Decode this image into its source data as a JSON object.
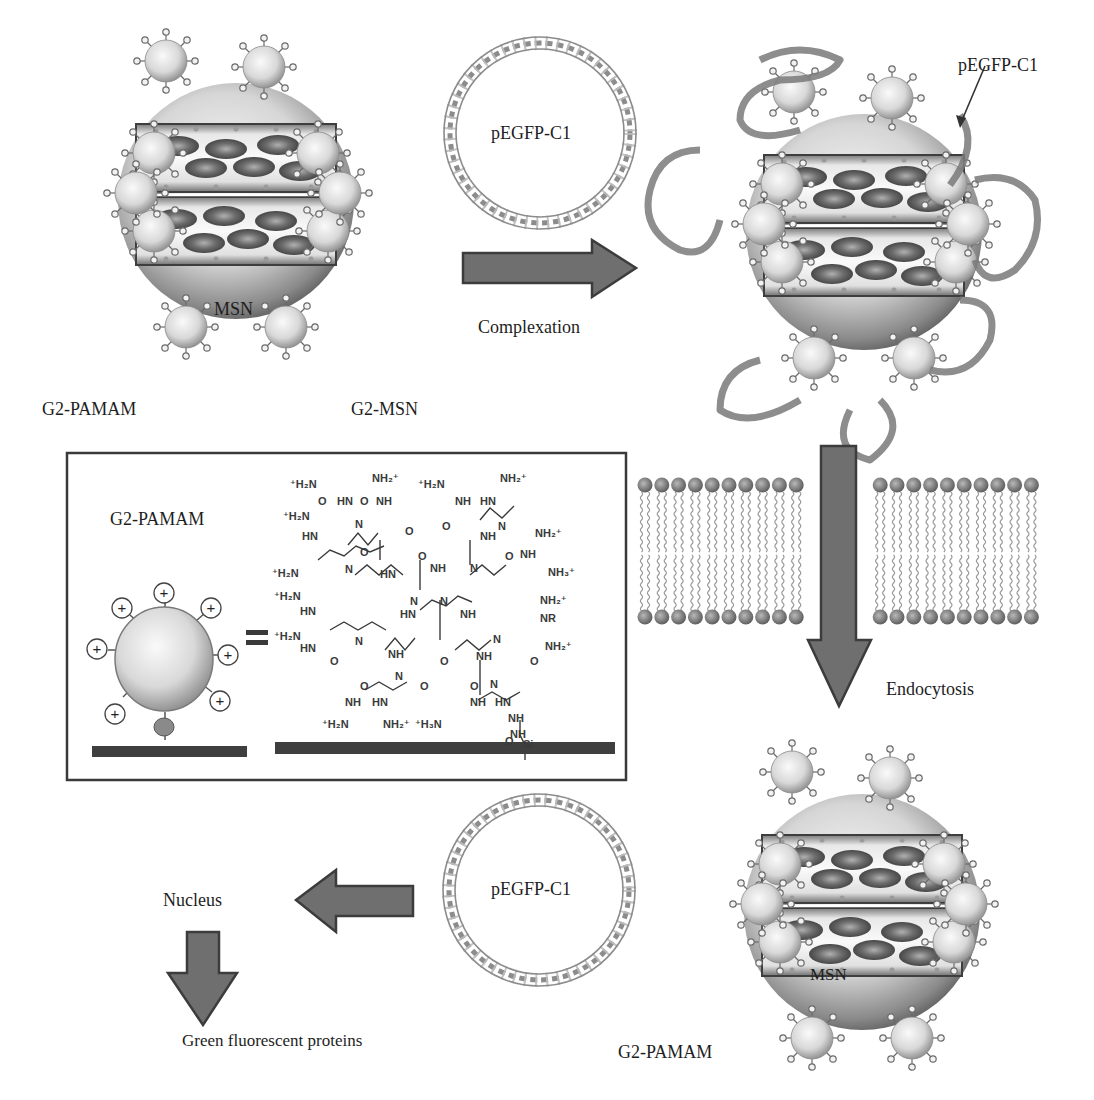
{
  "figure": {
    "colors": {
      "background": "#ffffff",
      "arrow_fill": "#6f6f6f",
      "arrow_stroke": "#3c3c3c",
      "sphere_light": "#f4f4f4",
      "sphere_dark": "#6a6a6a",
      "cargo_ellipse": "#5e5e5e",
      "plasmid_strand": "#8a8a8a",
      "membrane_head": "#808080",
      "membrane_tail": "#9a9a9a",
      "text": "#1e1e1e"
    }
  },
  "panel_top_left": {
    "core_label": "MSN",
    "dendrimer_label": "G2-PAMAM",
    "particle_label": "G2-MSN",
    "cargo_marker": "TH"
  },
  "panel_top_middle": {
    "plasmid_label": "pEGFP-C1",
    "arrow_label": "Complexation",
    "arrow_direction": "right"
  },
  "panel_top_right": {
    "plasmid_callout": "pEGFP-C1"
  },
  "inset_box": {
    "title": "G2-PAMAM",
    "equals_sign": "=",
    "charge_symbol": "+",
    "chemical_groups": [
      "+H2N",
      "NH2+",
      "HN",
      "NH",
      "O",
      "N",
      "H",
      "+H3N",
      "NH3+",
      "NHHN",
      "Si"
    ]
  },
  "membrane": {
    "arrow_label": "Endocytosis",
    "arrow_direction": "down"
  },
  "panel_bottom_right": {
    "core_label": "MSN",
    "dendrimer_label": "G2-PAMAM",
    "cargo_marker": "TH"
  },
  "panel_bottom_middle": {
    "plasmid_label": "pEGFP-C1",
    "arrow_direction": "left"
  },
  "panel_bottom_left": {
    "nucleus_label": "Nucleus",
    "result_label": "Green fluorescent proteins",
    "arrow_direction": "down"
  }
}
